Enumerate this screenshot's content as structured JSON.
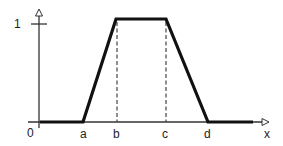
{
  "diagram": {
    "type": "trapezoidal-membership-function",
    "colors": {
      "background": "#ffffff",
      "curve": "#111111",
      "axis": "#333333",
      "dashed": "#444444",
      "text": "#222222"
    },
    "y_axis": {
      "tick_label": "1",
      "origin_label": "0"
    },
    "x_axis": {
      "label": "x",
      "points": [
        {
          "key": "a",
          "label": "a"
        },
        {
          "key": "b",
          "label": "b"
        },
        {
          "key": "c",
          "label": "c"
        },
        {
          "key": "d",
          "label": "d"
        }
      ]
    }
  }
}
